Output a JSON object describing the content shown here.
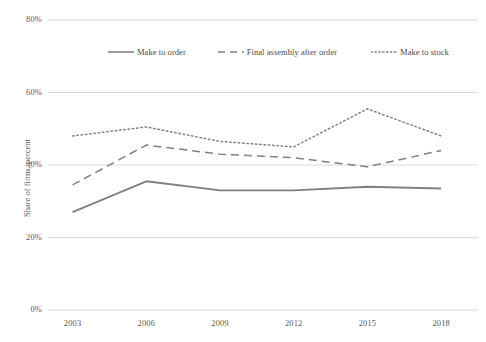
{
  "chart_data": {
    "type": "line",
    "title": "",
    "subtitle": "",
    "xlabel": "",
    "ylabel": "Share of firms, percent",
    "categories": [
      "2003",
      "2006",
      "2009",
      "2012",
      "2015",
      "2018"
    ],
    "x": [
      2003,
      2006,
      2009,
      2012,
      2015,
      2018
    ],
    "xlim": [
      2002,
      2019.5
    ],
    "ylim": [
      0,
      80
    ],
    "y_ticks": [
      0,
      20,
      40,
      60,
      80
    ],
    "y_tick_labels": [
      "0%",
      "20%",
      "40%",
      "60%",
      "80%"
    ],
    "grid": true,
    "grid_axis": "y",
    "legend_position": "top-inside",
    "series": [
      {
        "name": "Make to order",
        "style": "solid",
        "color": "#808080",
        "values": [
          27.0,
          35.5,
          33.0,
          33.0,
          34.0,
          33.5
        ]
      },
      {
        "name": "Final assembly after order",
        "style": "dashed",
        "color": "#808080",
        "values": [
          34.5,
          45.5,
          43.0,
          42.0,
          39.5,
          44.0
        ]
      },
      {
        "name": "Make to stock",
        "style": "dotted",
        "color": "#808080",
        "values": [
          48.0,
          50.5,
          46.5,
          45.0,
          55.5,
          48.0
        ]
      }
    ],
    "colors": {
      "line": "#808080",
      "grid": "#d9d9d9",
      "text": "#595959",
      "background": "#ffffff"
    }
  },
  "legend": {
    "items": [
      {
        "label": "Make to order",
        "swatch": "solid-line-swatch"
      },
      {
        "label": "Final assembly after order",
        "swatch": "dashed-line-swatch"
      },
      {
        "label": "Make to stock",
        "swatch": "dotted-line-swatch"
      }
    ]
  },
  "axes": {
    "y_label": "Share of firms, percent",
    "y_ticks": [
      "80%",
      "60%",
      "40%",
      "20%",
      "0%"
    ],
    "x_ticks": [
      "2003",
      "2006",
      "2009",
      "2012",
      "2015",
      "2018"
    ]
  }
}
